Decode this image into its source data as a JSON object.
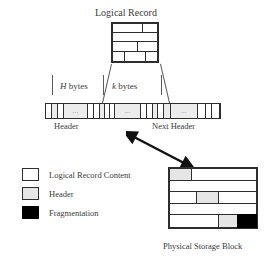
{
  "diagram": {
    "title": "Logical Record",
    "caption": "Physical Storage Block",
    "rulers": {
      "header_bytes": "H bytes",
      "header_bytes_symbol": "H",
      "header_bytes_unit": "bytes",
      "record_bytes": "k bytes",
      "record_bytes_symbol": "k",
      "record_bytes_unit": "bytes"
    },
    "strip_labels": {
      "header": "Header",
      "next_header": "Next Header"
    },
    "ellipsis": "...",
    "legend": [
      {
        "label": "Logical Record Content",
        "swatch": "white",
        "color": "#ffffff"
      },
      {
        "label": "Header",
        "swatch": "gray",
        "color": "#e6e6e6"
      },
      {
        "label": "Fragmentation",
        "swatch": "black",
        "color": "#000000"
      }
    ],
    "colors": {
      "stroke": "#2e2e2e",
      "text": "#3b3b3b",
      "content_fill": "#ffffff",
      "header_fill": "#e6e6e6",
      "fragmentation_fill": "#000000",
      "background": "#ffffff"
    },
    "arrow": {
      "name": "double-headed-mapping-arrow",
      "heads": 2,
      "direction": "diagonal-down-right"
    }
  }
}
